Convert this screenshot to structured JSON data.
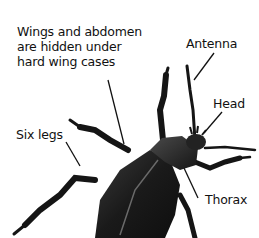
{
  "diagram": {
    "labels": [
      {
        "id": "wings",
        "lines": [
          "Wings and abdomen",
          "are hidden under",
          "hard wing cases"
        ],
        "x": 17,
        "y": 24
      },
      {
        "id": "antenna",
        "lines": [
          "Antenna"
        ],
        "x": 186,
        "y": 36
      },
      {
        "id": "head",
        "lines": [
          "Head"
        ],
        "x": 213,
        "y": 96
      },
      {
        "id": "six-legs",
        "lines": [
          "Six legs"
        ],
        "x": 16,
        "y": 127
      },
      {
        "id": "thorax",
        "lines": [
          "Thorax"
        ],
        "x": 205,
        "y": 192
      }
    ],
    "colors": {
      "background": "#ffffff",
      "text": "#111111",
      "beetle_body": "#1c1c1c",
      "beetle_highlight": "#5a5a5a",
      "leader_line": "#111111"
    }
  }
}
